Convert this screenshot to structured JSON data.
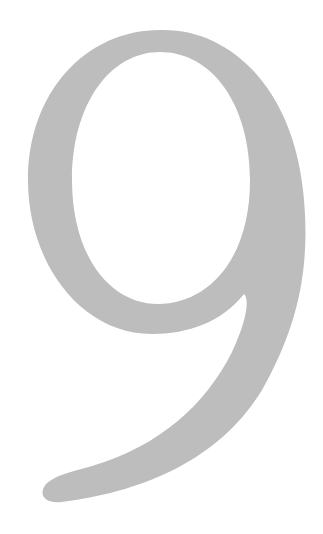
{
  "figure": {
    "glyph": "9",
    "glyph_description": "large serif numeral nine",
    "colors": {
      "background": "#ffffff",
      "glyph_fill": "#bdbdbd"
    }
  }
}
